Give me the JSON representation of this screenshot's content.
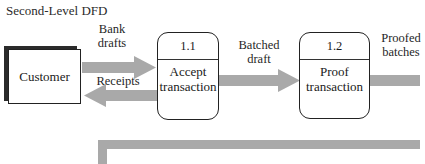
{
  "title": "Second-Level DFD",
  "entities": [
    {
      "label": "Customer"
    }
  ],
  "processes": [
    {
      "id": "1.1",
      "name_line1": "Accept",
      "name_line2": "transaction"
    },
    {
      "id": "1.2",
      "name_line1": "Proof",
      "name_line2": "transaction"
    }
  ],
  "flows": [
    {
      "line1": "Bank",
      "line2": "drafts",
      "direction": "right",
      "from": "Customer",
      "to": "1.1"
    },
    {
      "line1": "Receipts",
      "direction": "left",
      "from": "1.1",
      "to": "Customer"
    },
    {
      "line1": "Batched",
      "line2": "draft",
      "direction": "right",
      "from": "1.1",
      "to": "1.2"
    },
    {
      "line1": "Proofed",
      "line2": "batches",
      "direction": "right",
      "from": "1.2",
      "to": "offscreen"
    }
  ],
  "colors": {
    "arrow": "#a9a9a9",
    "border": "#222222",
    "shadow": "#2b2b2b"
  }
}
